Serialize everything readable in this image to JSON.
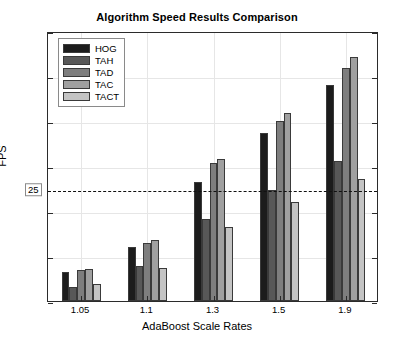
{
  "chart_data": {
    "type": "bar",
    "title": "Algorithm Speed Results Comparison",
    "xlabel": "AdaBoost Scale Rates",
    "ylabel": "FPS",
    "categories": [
      "1.05",
      "1.1",
      "1.3",
      "1.5",
      "1.9"
    ],
    "series": [
      {
        "name": "HOG",
        "color": "#1c1c1c",
        "values": [
          6.5,
          12.0,
          26.5,
          37.4,
          48.0
        ]
      },
      {
        "name": "TAH",
        "color": "#585858",
        "values": [
          3.1,
          7.8,
          18.3,
          24.6,
          31.2
        ]
      },
      {
        "name": "TAD",
        "color": "#7e7e7e",
        "values": [
          7.0,
          13.0,
          30.7,
          40.0,
          51.8
        ]
      },
      {
        "name": "TAC",
        "color": "#a0a0a0",
        "values": [
          7.2,
          13.5,
          31.6,
          41.8,
          54.2
        ]
      },
      {
        "name": "TACT",
        "color": "#c4c4c4",
        "values": [
          3.8,
          7.3,
          16.5,
          22.0,
          27.2
        ]
      }
    ],
    "ylim": [
      0,
      60
    ],
    "yticks": [
      0,
      10,
      20,
      30,
      40,
      50,
      60
    ],
    "ytick_labels": [
      "0",
      "10",
      "20",
      "30",
      "40",
      "50",
      "60"
    ],
    "threshold": {
      "value": 25,
      "label": "25",
      "style": "dashed",
      "boxed_tick": true
    },
    "grid": true,
    "legend_position": "upper left"
  }
}
